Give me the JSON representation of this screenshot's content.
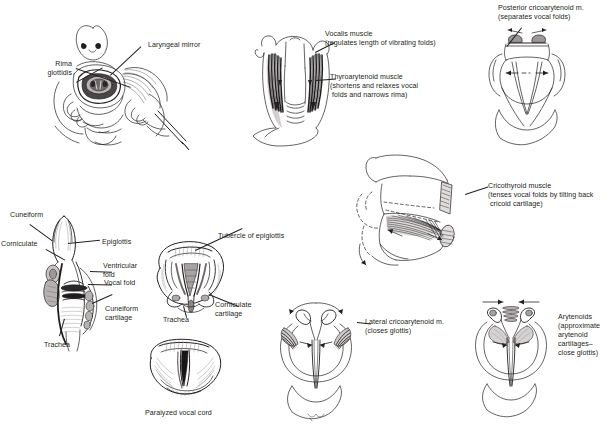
{
  "plate": {
    "title": "Larynx: laryngoscopy, cartilages and intrinsic muscles",
    "background_color": "#ffffff",
    "ink_color": "#231f20"
  },
  "panels": [
    {
      "id": "laryngoscopy",
      "name": "indirect-laryngoscopy",
      "labels": [
        {
          "id": "rima-glottidis",
          "text": "Rima\nglottidis"
        },
        {
          "id": "laryngeal-mirror",
          "text": "Laryngeal mirror"
        }
      ]
    },
    {
      "id": "anterior-larynx-muscles",
      "name": "anterior-larynx-with-vocalis-and-thyroarytenoid",
      "labels": [
        {
          "id": "vocalis-muscle",
          "text": "Vocalis muscle\n(regulates length of vibrating folds)"
        },
        {
          "id": "thyroarytenoid-muscle",
          "text": "Thyroarytenoid muscle\n(shortens and relaxes vocal\n folds and narrows rima)"
        }
      ]
    },
    {
      "id": "posterior-cricoarytenoid",
      "name": "posterior-cricoarytenoid-action",
      "labels": [
        {
          "id": "posterior-cricoarytenoid-m",
          "text": "Posterior cricoarytenoid m.\n(separates vocal folds)"
        }
      ]
    },
    {
      "id": "cricothyroid",
      "name": "cricothyroid-muscle-lateral-view",
      "labels": [
        {
          "id": "cricothyroid-muscle",
          "text": "Cricothyroid muscle\n(tenses vocal folds by tilting back\n cricoid cartilage)"
        }
      ]
    },
    {
      "id": "coronal-section",
      "name": "coronal-section-of-larynx",
      "labels": [
        {
          "id": "cuneiform",
          "text": "Cuneiform"
        },
        {
          "id": "corniculate",
          "text": "Corniculate"
        },
        {
          "id": "trachea-left",
          "text": "Trachea"
        },
        {
          "id": "epiglottis",
          "text": "Epiglottis"
        },
        {
          "id": "ventricular-fold",
          "text": "Ventricular\nfold"
        },
        {
          "id": "vocal-fold",
          "text": "Vocal fold"
        },
        {
          "id": "cuneiform-cartilage",
          "text": "Cuneiform\ncartilage"
        }
      ]
    },
    {
      "id": "laryngoscopic-open",
      "name": "laryngoscopic-view-open-glottis",
      "labels": [
        {
          "id": "tubercle-of-epiglottis",
          "text": "Tubercle of epiglottis"
        },
        {
          "id": "corniculate-cartilage",
          "text": "Corniculate\ncartilage"
        },
        {
          "id": "trachea-center",
          "text": "Trachea"
        }
      ]
    },
    {
      "id": "paralyzed-cord",
      "name": "paralyzed-vocal-cord-view",
      "labels": [
        {
          "id": "paralyzed-vocal-cord",
          "text": "Paralyzed vocal cord"
        }
      ]
    },
    {
      "id": "lateral-cricoarytenoid",
      "name": "lateral-cricoarytenoid-action",
      "labels": [
        {
          "id": "lateral-cricoarytenoid-m",
          "text": "Lateral cricoarytenoid m.\n(closes glottis)"
        }
      ]
    },
    {
      "id": "arytenoids",
      "name": "arytenoid-muscles-action",
      "labels": [
        {
          "id": "arytenoids",
          "text": "Arytenoids\n(approximate\narytenoid\ncartilages–\nclose glottis)"
        }
      ]
    }
  ],
  "labels": {
    "rima_glottidis": "Rima\nglottidis",
    "laryngeal_mirror": "Laryngeal mirror",
    "vocalis_muscle": "Vocalis muscle\n(regulates length of vibrating folds)",
    "thyroarytenoid_muscle": "Thyroarytenoid muscle\n(shortens and relaxes vocal\n folds and narrows rima)",
    "posterior_cricoarytenoid": "Posterior cricoarytenoid m.\n(separates vocal folds)",
    "cricothyroid_muscle": "Cricothyroid muscle\n(tenses vocal folds by tilting back\n cricoid cartilage)",
    "cuneiform": "Cuneiform",
    "corniculate": "Corniculate",
    "trachea_left": "Trachea",
    "epiglottis": "Epiglottis",
    "ventricular_fold": "Ventricular\nfold",
    "vocal_fold": "Vocal fold",
    "cuneiform_cartilage": "Cuneiform\ncartilage",
    "tubercle_of_epiglottis": "Tubercle of epiglottis",
    "corniculate_cartilage": "Corniculate\ncartilage",
    "trachea_center": "Trachea",
    "paralyzed_vocal_cord": "Paralyzed vocal cord",
    "lateral_cricoarytenoid": "Lateral cricoarytenoid m.\n(closes glottis)",
    "arytenoids": "Arytenoids\n(approximate\narytenoid\ncartilages–\nclose glottis)"
  }
}
